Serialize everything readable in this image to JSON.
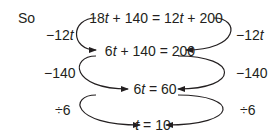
{
  "intro": "So",
  "equations": [
    {
      "parts": [
        "18",
        "t",
        " + 140 = 12",
        "t",
        " + 200"
      ]
    },
    {
      "parts": [
        "6",
        "t",
        " + 140 = 200",
        "",
        ""
      ]
    },
    {
      "parts": [
        "6",
        "t",
        " = 60",
        "",
        ""
      ]
    },
    {
      "parts": [
        "",
        "t",
        " = 10",
        "",
        ""
      ]
    }
  ],
  "operations": [
    {
      "left": "−12",
      "left_var": "t",
      "right": "−12",
      "right_var": "t"
    },
    {
      "left": "−140",
      "left_var": "",
      "right": "−140",
      "right_var": ""
    },
    {
      "left": "÷6",
      "left_var": "",
      "right": "÷6",
      "right_var": ""
    }
  ]
}
